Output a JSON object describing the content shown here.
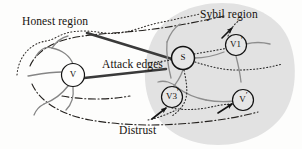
{
  "figure": {
    "type": "network-diagram",
    "title_visible": false,
    "background_color": "#fdfdfc",
    "regions": [
      {
        "id": "honest",
        "label": "Honest region",
        "label_position": {
          "x": 22,
          "y": 16
        },
        "fill": "none",
        "boundary_style": "dotted"
      },
      {
        "id": "sybil",
        "label": "Sybil region",
        "label_position": {
          "x": 200,
          "y": 9
        },
        "fill": "#e2e2e2",
        "boundary_style": "none"
      }
    ],
    "edge_labels": [
      {
        "id": "attack-edges",
        "label": "Attack edges",
        "label_position": {
          "x": 102,
          "y": 59
        },
        "style": "thick-solid",
        "color": "#3a3a3a",
        "count": 2
      },
      {
        "id": "distrust",
        "label": "Distrust",
        "label_position": {
          "x": 119,
          "y": 125
        },
        "style": "dash-dot",
        "color": "#2a2a2a"
      }
    ],
    "nodes": [
      {
        "id": "v-honest",
        "label": "V",
        "prime": false,
        "cx": 73,
        "cy": 75,
        "r": 11.5,
        "region": "honest"
      },
      {
        "id": "s",
        "label": "S",
        "prime": false,
        "cx": 183,
        "cy": 58,
        "r": 11.5,
        "region": "sybil"
      },
      {
        "id": "v1-prime",
        "label": "V1",
        "prime": true,
        "cx": 236,
        "cy": 45,
        "r": 10.5,
        "region": "sybil"
      },
      {
        "id": "v3-prime",
        "label": "V3",
        "prime": true,
        "cx": 172,
        "cy": 97,
        "r": 10.5,
        "region": "sybil"
      },
      {
        "id": "v-prime",
        "label": "V",
        "prime": true,
        "cx": 243,
        "cy": 100,
        "r": 10.5,
        "region": "sybil"
      }
    ],
    "colors": {
      "sybil_fill": "#e2e2e2",
      "ink": "#16120f",
      "attack_edge": "#3a3a3a",
      "honest_link": "#7c7c7c",
      "sybil_link": "#8a8a8a",
      "boundary": "#2a2a2a"
    }
  }
}
